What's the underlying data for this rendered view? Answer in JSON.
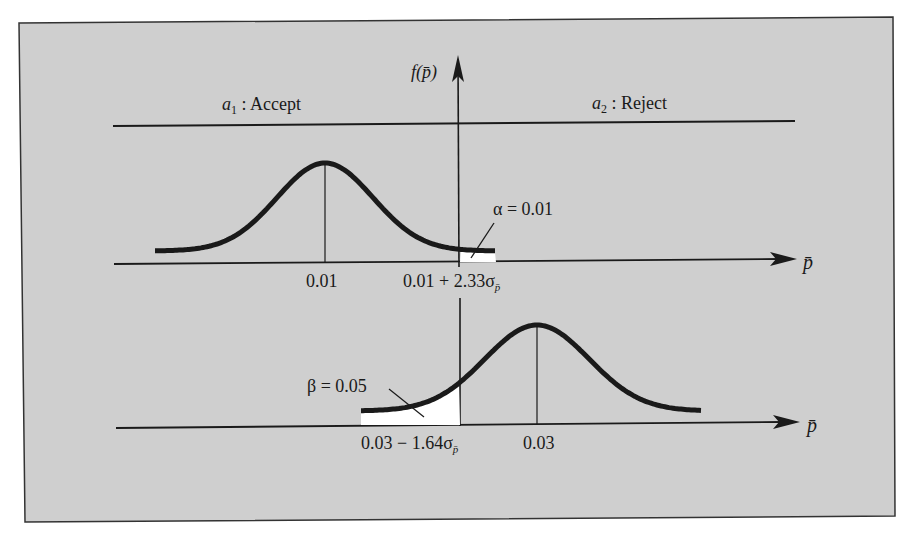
{
  "figure": {
    "y_axis_label": "f(p̄)",
    "x_axis_label_upper": "p̄",
    "x_axis_label_lower": "p̄",
    "regions": {
      "accept": {
        "symbol": "a",
        "subscript": "1",
        "text": " : Accept"
      },
      "reject": {
        "symbol": "a",
        "subscript": "2",
        "text": " : Reject"
      }
    },
    "upper_distribution": {
      "mean_label": "0.01",
      "critical_label_prefix": "0.01 + 2.33σ",
      "critical_label_subscript": "p̄",
      "tail_label": "α = 0.01",
      "tail_side": "right",
      "tail_probability": 0.01
    },
    "lower_distribution": {
      "mean_label": "0.03",
      "critical_label_prefix": "0.03 − 1.64σ",
      "critical_label_subscript": "p̄",
      "tail_label": "β = 0.05",
      "tail_side": "left",
      "tail_probability": 0.05
    }
  },
  "colors": {
    "panel_background": "#cfcfcf",
    "ink": "#1a1a1a",
    "tail_fill": "#ffffff"
  }
}
